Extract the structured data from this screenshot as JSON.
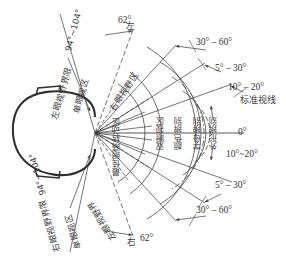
{
  "diagram": {
    "type": "visual-field-top-view",
    "colors": {
      "line": "#3a3a3a",
      "head_outline": "#2f2f2f",
      "text": "#3d3d3d",
      "background": "#ffffff"
    },
    "vertex": {
      "x": 95,
      "y": 133
    }
  },
  "labels": {
    "left_field_limit": "左眼视野界限",
    "right_field_limit": "右眼视野界限",
    "monocular_zone_top": "单眼视区",
    "monocular_zone_bottom": "单眼视区",
    "right_eye_field_zone": "右眼视野区",
    "left_eye_field_zone": "左眼视野界",
    "best_eye_rotation_zone": "最佳眼睛转动区",
    "binocular_zone": "双眼视区",
    "color_discrimination": "颜色辨别",
    "letter_discrimination": "字母辨别",
    "shape_discrimination": "外形辨别",
    "standard_line_of_sight": "标准视线",
    "left_marker": "左",
    "right_marker": "右"
  },
  "angles": {
    "top_62": "62°",
    "bottom_62": "62°",
    "top_mono_range": "94°~104°",
    "bottom_mono_range": "94°~104°",
    "top_30_60": "30° – 60°",
    "top_5_30": "5° – 30°",
    "right_10_20_upper": "10° – 20°",
    "zero": "0°",
    "right_10_20_lower": "10°~20°",
    "bottom_5_30": "5° – 30°",
    "bottom_30_60": "30° – 60°"
  }
}
